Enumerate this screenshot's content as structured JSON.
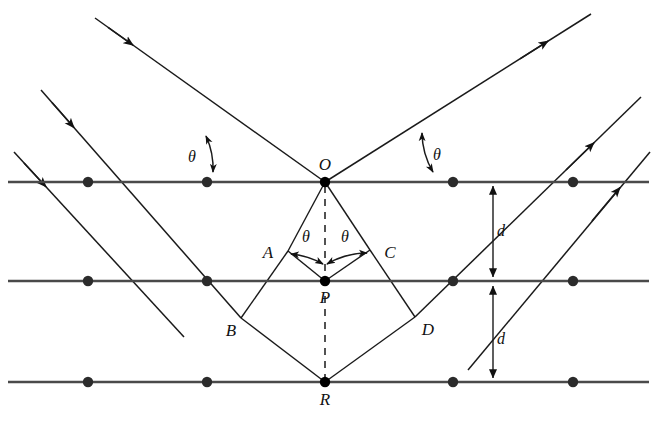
{
  "figure": {
    "type": "physics-diagram",
    "background_color": "#ffffff",
    "line_color": "#1a1a1a",
    "lattice_color": "#4a4a4a",
    "dot_color": "#2b2b2b"
  },
  "labels": {
    "point_O": "O",
    "point_P": "P",
    "point_R": "R",
    "point_A": "A",
    "point_B": "B",
    "point_C": "C",
    "point_D": "D",
    "theta_incident_left": "θ",
    "theta_reflected_right": "θ",
    "theta_inner_left": "θ",
    "theta_inner_right": "θ",
    "spacing_upper": "d",
    "spacing_lower": "d"
  },
  "geometry": {
    "lattice_rows": [
      {
        "name": "top-plane",
        "y": 182,
        "x_start": 8,
        "x_end": 649,
        "dots_x": [
          88,
          207,
          453,
          573
        ]
      },
      {
        "name": "middle-plane",
        "y": 281,
        "x_start": 8,
        "x_end": 649,
        "dots_x": [
          88,
          207,
          453,
          573
        ]
      },
      {
        "name": "bottom-plane",
        "y": 382,
        "x_start": 8,
        "x_end": 649,
        "dots_x": [
          88,
          207,
          453,
          573
        ]
      }
    ],
    "vertices": {
      "O": {
        "x": 325,
        "y": 182
      },
      "P": {
        "x": 325,
        "y": 281
      },
      "R": {
        "x": 325,
        "y": 382
      },
      "A": {
        "x": 288,
        "y": 251
      },
      "B": {
        "x": 241,
        "y": 318
      },
      "C": {
        "x": 370,
        "y": 250
      },
      "D": {
        "x": 415,
        "y": 317
      }
    },
    "label_positions": {
      "O": {
        "x": 325,
        "y": 170
      },
      "P": {
        "x": 325,
        "y": 302
      },
      "R": {
        "x": 325,
        "y": 404
      },
      "A": {
        "x": 266,
        "y": 257
      },
      "B": {
        "x": 230,
        "y": 335
      },
      "C": {
        "x": 390,
        "y": 257
      },
      "D": {
        "x": 427,
        "y": 334
      },
      "theta_left": {
        "x": 192,
        "y": 160
      },
      "theta_right": {
        "x": 436,
        "y": 158
      },
      "theta_inner_left": {
        "x": 305,
        "y": 240
      },
      "theta_inner_right": {
        "x": 345,
        "y": 240
      },
      "d_upper": {
        "x": 500,
        "y": 234
      },
      "d_lower": {
        "x": 500,
        "y": 342
      }
    },
    "rays": {
      "incident_angle_deg": 39,
      "incoming": [
        {
          "name": "incident-ray-1",
          "from": {
            "x": 95,
            "y": 18
          },
          "to": {
            "x": 325,
            "y": 182
          },
          "arrow_t": 0.14
        },
        {
          "name": "incident-ray-2",
          "from": {
            "x": 41,
            "y": 90
          },
          "to": {
            "x": 241,
            "y": 318
          },
          "arrow_t": 0.13
        },
        {
          "name": "incident-ray-3",
          "from": {
            "x": 14,
            "y": 152
          },
          "to": {
            "x": 180,
            "y": 332
          },
          "arrow_t": 0.18
        }
      ],
      "outgoing": [
        {
          "name": "reflected-ray-1",
          "from": {
            "x": 325,
            "y": 182
          },
          "to": {
            "x": 591,
            "y": 14
          },
          "arrow_t": 0.8
        },
        {
          "name": "reflected-ray-2",
          "from": {
            "x": 415,
            "y": 317
          },
          "to": {
            "x": 641,
            "y": 97
          },
          "arrow_t": 0.86
        },
        {
          "name": "reflected-ray-3",
          "from": {
            "x": 470,
            "y": 372
          },
          "to": {
            "x": 648,
            "y": 150
          },
          "arrow_t": 0.9
        }
      ]
    },
    "dimension_line_x": 493
  }
}
